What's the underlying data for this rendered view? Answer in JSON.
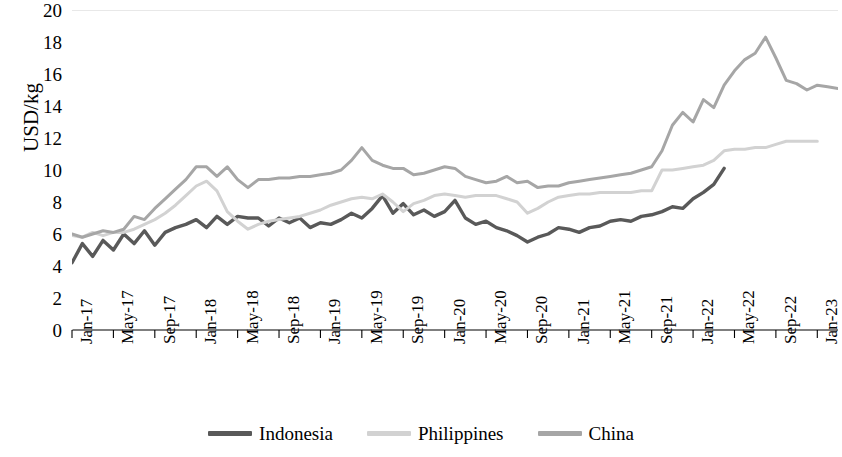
{
  "chart_data": {
    "type": "line",
    "title": "",
    "xlabel": "",
    "ylabel": "USD/kg",
    "ylim": [
      0,
      20
    ],
    "ytick_step": 2,
    "yticks": [
      "20",
      "18",
      "16",
      "14",
      "12",
      "10",
      "8",
      "6",
      "4",
      "2",
      "0"
    ],
    "grid": false,
    "legend_position": "bottom",
    "xtick_labels": [
      "Jan-17",
      "May-17",
      "Sep-17",
      "Jan-18",
      "May-18",
      "Sep-18",
      "Jan-19",
      "May-19",
      "Sep-19",
      "Jan-20",
      "May-20",
      "Sep-20",
      "Jan-21",
      "May-21",
      "Sep-21",
      "Jan-22",
      "May-22",
      "Sep-22",
      "Jan-23"
    ],
    "x": [
      "Jan-17",
      "Feb-17",
      "Mar-17",
      "Apr-17",
      "May-17",
      "Jun-17",
      "Jul-17",
      "Aug-17",
      "Sep-17",
      "Oct-17",
      "Nov-17",
      "Dec-17",
      "Jan-18",
      "Feb-18",
      "Mar-18",
      "Apr-18",
      "May-18",
      "Jun-18",
      "Jul-18",
      "Aug-18",
      "Sep-18",
      "Oct-18",
      "Nov-18",
      "Dec-18",
      "Jan-19",
      "Feb-19",
      "Mar-19",
      "Apr-19",
      "May-19",
      "Jun-19",
      "Jul-19",
      "Aug-19",
      "Sep-19",
      "Oct-19",
      "Nov-19",
      "Dec-19",
      "Jan-20",
      "Feb-20",
      "Mar-20",
      "Apr-20",
      "May-20",
      "Jun-20",
      "Jul-20",
      "Aug-20",
      "Sep-20",
      "Oct-20",
      "Nov-20",
      "Dec-20",
      "Jan-21",
      "Feb-21",
      "Mar-21",
      "Apr-21",
      "May-21",
      "Jun-21",
      "Jul-21",
      "Aug-21",
      "Sep-21",
      "Oct-21",
      "Nov-21",
      "Dec-21",
      "Jan-22",
      "Feb-22",
      "Mar-22",
      "Apr-22",
      "May-22",
      "Jun-22",
      "Jul-22",
      "Aug-22",
      "Sep-22",
      "Oct-22",
      "Nov-22",
      "Dec-22",
      "Jan-23",
      "Feb-23",
      "Mar-23"
    ],
    "series": [
      {
        "name": "Indonesia",
        "color": "#595959",
        "values": [
          4.2,
          5.4,
          4.6,
          5.6,
          5.0,
          6.0,
          5.4,
          6.2,
          5.3,
          6.1,
          6.4,
          6.6,
          6.9,
          6.4,
          7.1,
          6.6,
          7.1,
          7.0,
          7.0,
          6.5,
          7.0,
          6.7,
          7.0,
          6.4,
          6.7,
          6.6,
          6.9,
          7.3,
          7.0,
          7.6,
          8.4,
          7.3,
          7.9,
          7.2,
          7.5,
          7.1,
          7.4,
          8.1,
          7.0,
          6.6,
          6.8,
          6.4,
          6.2,
          5.9,
          5.5,
          5.8,
          6.0,
          6.4,
          6.3,
          6.1,
          6.4,
          6.5,
          6.8,
          6.9,
          6.8,
          7.1,
          7.2,
          7.4,
          7.7,
          7.6,
          8.2,
          8.6,
          9.1,
          10.1,
          null,
          null,
          null,
          null,
          null,
          null,
          null,
          null,
          null,
          null,
          null
        ]
      },
      {
        "name": "Philippines",
        "color": "#d2d2d2",
        "values": [
          5.9,
          5.8,
          6.1,
          5.9,
          6.1,
          6.1,
          6.3,
          6.6,
          6.9,
          7.3,
          7.8,
          8.4,
          9.0,
          9.3,
          8.7,
          7.4,
          6.8,
          6.3,
          6.6,
          6.8,
          6.9,
          7.0,
          7.1,
          7.3,
          7.5,
          7.8,
          8.0,
          8.2,
          8.3,
          8.2,
          8.5,
          8.0,
          7.4,
          7.9,
          8.1,
          8.4,
          8.5,
          8.4,
          8.3,
          8.4,
          8.4,
          8.4,
          8.2,
          8.0,
          7.3,
          7.6,
          8.0,
          8.3,
          8.4,
          8.5,
          8.5,
          8.6,
          8.6,
          8.6,
          8.6,
          8.7,
          8.7,
          10.0,
          10.0,
          10.1,
          10.2,
          10.3,
          10.6,
          11.2,
          11.3,
          11.3,
          11.4,
          11.4,
          11.6,
          11.8,
          11.8,
          11.8,
          11.8,
          null,
          null
        ]
      },
      {
        "name": "China",
        "color": "#a6a6a6",
        "values": [
          6.0,
          5.8,
          6.0,
          6.2,
          6.1,
          6.3,
          7.1,
          6.9,
          7.6,
          8.2,
          8.8,
          9.4,
          10.2,
          10.2,
          9.6,
          10.2,
          9.4,
          8.9,
          9.4,
          9.4,
          9.5,
          9.5,
          9.6,
          9.6,
          9.7,
          9.8,
          10.0,
          10.6,
          11.4,
          10.6,
          10.3,
          10.1,
          10.1,
          9.7,
          9.8,
          10.0,
          10.2,
          10.1,
          9.6,
          9.4,
          9.2,
          9.3,
          9.6,
          9.2,
          9.3,
          8.9,
          9.0,
          9.0,
          9.2,
          9.3,
          9.4,
          9.5,
          9.6,
          9.7,
          9.8,
          10.0,
          10.2,
          11.2,
          12.8,
          13.6,
          13.0,
          14.4,
          13.9,
          15.3,
          16.2,
          16.9,
          17.3,
          18.3,
          17.0,
          15.6,
          15.4,
          15.0,
          15.3,
          15.2,
          15.1
        ]
      }
    ]
  },
  "legend": {
    "items": [
      {
        "label": "Indonesia"
      },
      {
        "label": "Philippines"
      },
      {
        "label": "China"
      }
    ]
  }
}
